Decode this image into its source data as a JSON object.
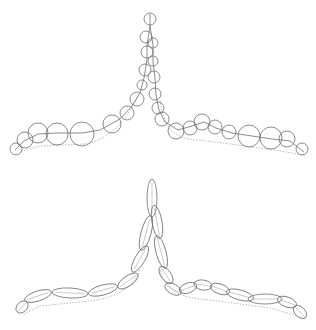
{
  "figure": {
    "width": 316,
    "height": 330,
    "stroke": "#6e6e6e",
    "dotted": "#a8a8a8",
    "background": "#ffffff"
  },
  "top_panel": {
    "label": "circle-approximation",
    "skeleton": "M150,14 L150,26 L147,45 L147,60 L144,78 L140,93 L132,106 L120,119 L100,130 L82,133 L57,133 L38,134 L24,141 L15,150",
    "skeleton_right": "M150,26 L153,45 L153,62 L155,78 L156,95 L159,110 L165,122 L178,130 L192,126 L204,122 L216,128 L232,133 L252,136 L272,139 L290,141 L304,152",
    "outline_dotted": "M138,96 C128,118 110,140 85,144 L40,146 L20,152 M160,100 C164,126 172,140 200,140 L260,148 L305,155",
    "circles": [
      {
        "cx": 150,
        "cy": 19,
        "r": 6
      },
      {
        "cx": 146,
        "cy": 37,
        "r": 6
      },
      {
        "cx": 153,
        "cy": 43,
        "r": 5
      },
      {
        "cx": 147,
        "cy": 52,
        "r": 6
      },
      {
        "cx": 153,
        "cy": 61,
        "r": 5
      },
      {
        "cx": 145,
        "cy": 70,
        "r": 6
      },
      {
        "cx": 154,
        "cy": 77,
        "r": 6
      },
      {
        "cx": 142,
        "cy": 85,
        "r": 5
      },
      {
        "cx": 155,
        "cy": 94,
        "r": 6
      },
      {
        "cx": 137,
        "cy": 99,
        "r": 7
      },
      {
        "cx": 158,
        "cy": 108,
        "r": 6
      },
      {
        "cx": 127,
        "cy": 113,
        "r": 7
      },
      {
        "cx": 162,
        "cy": 119,
        "r": 7
      },
      {
        "cx": 112,
        "cy": 124,
        "r": 9
      },
      {
        "cx": 176,
        "cy": 131,
        "r": 8
      },
      {
        "cx": 82,
        "cy": 134,
        "r": 12
      },
      {
        "cx": 190,
        "cy": 128,
        "r": 7
      },
      {
        "cx": 57,
        "cy": 134,
        "r": 11
      },
      {
        "cx": 202,
        "cy": 122,
        "r": 8
      },
      {
        "cx": 38,
        "cy": 133,
        "r": 10
      },
      {
        "cx": 215,
        "cy": 127,
        "r": 7
      },
      {
        "cx": 25,
        "cy": 140,
        "r": 8
      },
      {
        "cx": 229,
        "cy": 132,
        "r": 7
      },
      {
        "cx": 16,
        "cy": 149,
        "r": 6
      },
      {
        "cx": 249,
        "cy": 136,
        "r": 11
      },
      {
        "cx": 271,
        "cy": 138,
        "r": 11
      },
      {
        "cx": 287,
        "cy": 139,
        "r": 8
      },
      {
        "cx": 302,
        "cy": 149,
        "r": 6
      }
    ]
  },
  "bottom_panel": {
    "label": "ellipse-approximation",
    "outline_dotted": "M140,270 C132,290 112,300 80,302 L40,306 L22,315 M160,270 C166,290 178,298 210,300 L270,308 L305,318",
    "ellipses": [
      {
        "cx": 152,
        "cy": 198,
        "rx": 5,
        "ry": 19,
        "rot": 0
      },
      {
        "cx": 157,
        "cy": 222,
        "rx": 5,
        "ry": 17,
        "rot": -10
      },
      {
        "cx": 146,
        "cy": 233,
        "rx": 5,
        "ry": 18,
        "rot": 15
      },
      {
        "cx": 161,
        "cy": 252,
        "rx": 5,
        "ry": 17,
        "rot": -15
      },
      {
        "cx": 140,
        "cy": 259,
        "rx": 5,
        "ry": 15,
        "rot": 30
      },
      {
        "cx": 166,
        "cy": 275,
        "rx": 5,
        "ry": 10,
        "rot": -35
      },
      {
        "cx": 128,
        "cy": 281,
        "rx": 5,
        "ry": 12,
        "rot": 55
      },
      {
        "cx": 173,
        "cy": 289,
        "rx": 5,
        "ry": 9,
        "rot": -60
      },
      {
        "cx": 103,
        "cy": 290,
        "rx": 15,
        "ry": 5,
        "rot": -15
      },
      {
        "cx": 188,
        "cy": 288,
        "rx": 9,
        "ry": 5,
        "rot": -20
      },
      {
        "cx": 70,
        "cy": 293,
        "rx": 18,
        "ry": 5,
        "rot": 3
      },
      {
        "cx": 203,
        "cy": 285,
        "rx": 9,
        "ry": 5,
        "rot": 8
      },
      {
        "cx": 38,
        "cy": 296,
        "rx": 14,
        "ry": 5,
        "rot": -18
      },
      {
        "cx": 220,
        "cy": 289,
        "rx": 10,
        "ry": 5,
        "rot": 20
      },
      {
        "cx": 22,
        "cy": 307,
        "rx": 7,
        "ry": 5,
        "rot": -45
      },
      {
        "cx": 240,
        "cy": 295,
        "rx": 14,
        "ry": 5,
        "rot": 15
      },
      {
        "cx": 265,
        "cy": 299,
        "rx": 17,
        "ry": 5,
        "rot": 0
      },
      {
        "cx": 287,
        "cy": 302,
        "rx": 10,
        "ry": 5,
        "rot": 20
      },
      {
        "cx": 300,
        "cy": 312,
        "rx": 8,
        "ry": 5,
        "rot": 45
      }
    ]
  }
}
